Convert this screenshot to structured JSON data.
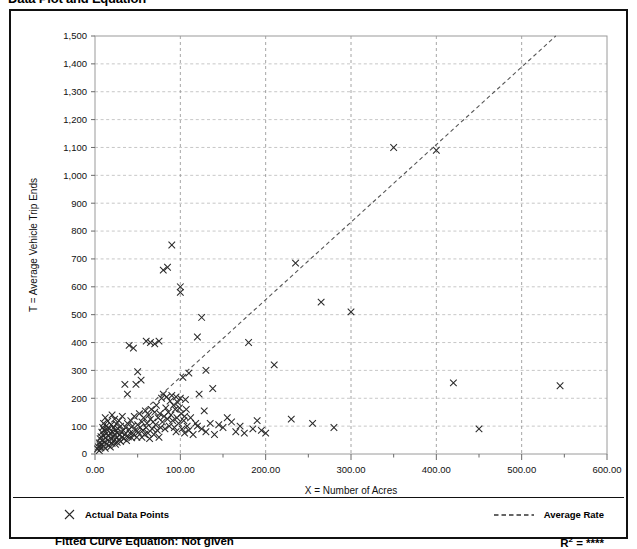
{
  "page": {
    "title": "Data Plot and Equation"
  },
  "legend": {
    "data_points_label": "Actual Data Points",
    "data_points_marker": "x-marker-icon",
    "average_rate_label": "Average Rate",
    "average_rate_marker": "dashed-line-icon"
  },
  "footer": {
    "equation_label": "Fitted Curve Equation:",
    "equation_value": "Not given",
    "equation_full": "Fitted Curve Equation:  Not given",
    "r2_label": "R",
    "r2_sup": "2",
    "r2_eq": " = ",
    "r2_value": "****"
  },
  "colors": {
    "marker": "#2a2a2a",
    "trend": "#555555",
    "grid_horizontal": "#b9b9b9",
    "grid_vertical": "#8e8e8e",
    "axis": "#888888",
    "frame": "#111111",
    "background": "#ffffff"
  },
  "chart_data": {
    "type": "scatter",
    "title": "Data Plot and Equation",
    "xlabel": "X = Number of Acres",
    "ylabel": "T = Average Vehicle Trip Ends",
    "xlim": [
      0,
      600
    ],
    "ylim": [
      0,
      1500
    ],
    "xticks": [
      0,
      100,
      200,
      300,
      400,
      500,
      600
    ],
    "xticklabels": [
      "0.00",
      "100.00",
      "200.00",
      "300.00",
      "400.00",
      "500.00",
      "600.00"
    ],
    "xminor_step": 50,
    "yticks": [
      0,
      100,
      200,
      300,
      400,
      500,
      600,
      700,
      800,
      900,
      1000,
      1100,
      1200,
      1300,
      1400,
      1500
    ],
    "yticklabels": [
      "0",
      "100",
      "200",
      "300",
      "400",
      "500",
      "600",
      "700",
      "800",
      "900",
      "1,000",
      "1,100",
      "1,200",
      "1,300",
      "1,400",
      "1,500"
    ],
    "grid": true,
    "legend_position": "below-plot",
    "series": [
      {
        "name": "Actual Data Points",
        "marker": "x",
        "color": "#2a2a2a",
        "points": [
          [
            3,
            18
          ],
          [
            4,
            25
          ],
          [
            5,
            12
          ],
          [
            5,
            40
          ],
          [
            6,
            30
          ],
          [
            6,
            55
          ],
          [
            7,
            22
          ],
          [
            7,
            62
          ],
          [
            8,
            35
          ],
          [
            8,
            78
          ],
          [
            9,
            48
          ],
          [
            9,
            95
          ],
          [
            10,
            28
          ],
          [
            10,
            66
          ],
          [
            10,
            110
          ],
          [
            11,
            42
          ],
          [
            11,
            85
          ],
          [
            12,
            20
          ],
          [
            12,
            58
          ],
          [
            12,
            130
          ],
          [
            13,
            72
          ],
          [
            13,
            100
          ],
          [
            14,
            36
          ],
          [
            14,
            88
          ],
          [
            15,
            50
          ],
          [
            15,
            118
          ],
          [
            16,
            30
          ],
          [
            16,
            65
          ],
          [
            17,
            45
          ],
          [
            17,
            92
          ],
          [
            18,
            25
          ],
          [
            18,
            75
          ],
          [
            19,
            55
          ],
          [
            19,
            105
          ],
          [
            20,
            38
          ],
          [
            20,
            80
          ],
          [
            20,
            140
          ],
          [
            21,
            60
          ],
          [
            22,
            48
          ],
          [
            22,
            95
          ],
          [
            23,
            70
          ],
          [
            23,
            125
          ],
          [
            24,
            35
          ],
          [
            24,
            85
          ],
          [
            25,
            58
          ],
          [
            25,
            108
          ],
          [
            26,
            42
          ],
          [
            26,
            75
          ],
          [
            27,
            90
          ],
          [
            28,
            52
          ],
          [
            28,
            120
          ],
          [
            29,
            68
          ],
          [
            30,
            45
          ],
          [
            30,
            100
          ],
          [
            31,
            78
          ],
          [
            32,
            60
          ],
          [
            32,
            135
          ],
          [
            33,
            85
          ],
          [
            34,
            55
          ],
          [
            35,
            70
          ],
          [
            35,
            250
          ],
          [
            36,
            95
          ],
          [
            37,
            48
          ],
          [
            38,
            110
          ],
          [
            38,
            215
          ],
          [
            39,
            62
          ],
          [
            40,
            88
          ],
          [
            40,
            390
          ],
          [
            41,
            75
          ],
          [
            42,
            120
          ],
          [
            43,
            58
          ],
          [
            44,
            100
          ],
          [
            45,
            70
          ],
          [
            45,
            380
          ],
          [
            46,
            135
          ],
          [
            47,
            85
          ],
          [
            48,
            250
          ],
          [
            49,
            60
          ],
          [
            50,
            105
          ],
          [
            50,
            295
          ],
          [
            51,
            78
          ],
          [
            52,
            145
          ],
          [
            53,
            95
          ],
          [
            54,
            265
          ],
          [
            55,
            115
          ],
          [
            55,
            60
          ],
          [
            56,
            85
          ],
          [
            57,
            130
          ],
          [
            58,
            70
          ],
          [
            59,
            155
          ],
          [
            60,
            95
          ],
          [
            60,
            405
          ],
          [
            61,
            110
          ],
          [
            62,
            75
          ],
          [
            63,
            140
          ],
          [
            64,
            55
          ],
          [
            65,
            125
          ],
          [
            65,
            400
          ],
          [
            66,
            160
          ],
          [
            67,
            90
          ],
          [
            68,
            115
          ],
          [
            69,
            70
          ],
          [
            70,
            150
          ],
          [
            70,
            395
          ],
          [
            71,
            105
          ],
          [
            72,
            175
          ],
          [
            73,
            85
          ],
          [
            74,
            130
          ],
          [
            75,
            60
          ],
          [
            75,
            405
          ],
          [
            76,
            145
          ],
          [
            77,
            95
          ],
          [
            78,
            200
          ],
          [
            79,
            115
          ],
          [
            80,
            215
          ],
          [
            80,
            660
          ],
          [
            81,
            135
          ],
          [
            82,
            90
          ],
          [
            83,
            165
          ],
          [
            84,
            205
          ],
          [
            85,
            125
          ],
          [
            85,
            670
          ],
          [
            86,
            150
          ],
          [
            87,
            100
          ],
          [
            88,
            190
          ],
          [
            89,
            140
          ],
          [
            90,
            210
          ],
          [
            90,
            750
          ],
          [
            91,
            120
          ],
          [
            92,
            175
          ],
          [
            93,
            95
          ],
          [
            94,
            160
          ],
          [
            95,
            205
          ],
          [
            95,
            80
          ],
          [
            96,
            130
          ],
          [
            97,
            185
          ],
          [
            98,
            110
          ],
          [
            99,
            165
          ],
          [
            100,
            200
          ],
          [
            100,
            580
          ],
          [
            100,
            600
          ],
          [
            101,
            145
          ],
          [
            102,
            90
          ],
          [
            103,
            275
          ],
          [
            104,
            120
          ],
          [
            105,
            135
          ],
          [
            105,
            75
          ],
          [
            106,
            195
          ],
          [
            107,
            160
          ],
          [
            108,
            100
          ],
          [
            110,
            290
          ],
          [
            110,
            85
          ],
          [
            112,
            130
          ],
          [
            115,
            70
          ],
          [
            118,
            110
          ],
          [
            120,
            420
          ],
          [
            120,
            100
          ],
          [
            122,
            215
          ],
          [
            125,
            490
          ],
          [
            125,
            90
          ],
          [
            128,
            155
          ],
          [
            130,
            300
          ],
          [
            130,
            80
          ],
          [
            135,
            110
          ],
          [
            138,
            235
          ],
          [
            140,
            70
          ],
          [
            145,
            105
          ],
          [
            150,
            95
          ],
          [
            155,
            130
          ],
          [
            160,
            115
          ],
          [
            165,
            80
          ],
          [
            170,
            100
          ],
          [
            175,
            75
          ],
          [
            180,
            400
          ],
          [
            185,
            90
          ],
          [
            190,
            120
          ],
          [
            195,
            85
          ],
          [
            200,
            75
          ],
          [
            210,
            320
          ],
          [
            230,
            125
          ],
          [
            235,
            685
          ],
          [
            255,
            110
          ],
          [
            265,
            545
          ],
          [
            280,
            95
          ],
          [
            300,
            510
          ],
          [
            350,
            1100
          ],
          [
            400,
            1090
          ],
          [
            420,
            255
          ],
          [
            450,
            90
          ],
          [
            545,
            245
          ]
        ]
      },
      {
        "name": "Average Rate",
        "type": "line",
        "style": "dashed",
        "color": "#555555",
        "x": [
          10,
          540
        ],
        "y": [
          25,
          1500
        ]
      }
    ]
  }
}
